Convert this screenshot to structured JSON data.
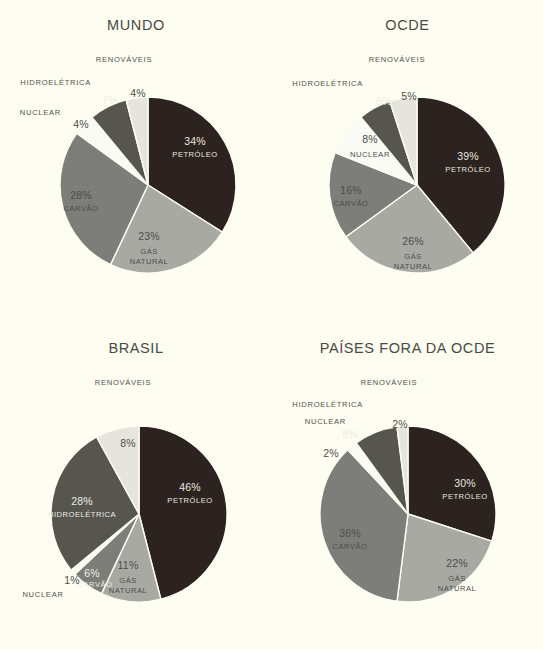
{
  "background": "#fdfdf2",
  "palette": {
    "petroleo": "#2c2220",
    "gas_natural": "#a9a9a4",
    "carvao": "#7d7d79",
    "nuclear": "#fbfbf6",
    "hidroeletrica": "#56564f",
    "renovaveis": "#e6e5dd"
  },
  "category_labels": {
    "petroleo": "PETRÓLEO",
    "gas_natural_line1": "GÁS",
    "gas_natural_line2": "NATURAL",
    "carvao": "CARVÃO",
    "nuclear": "NUCLEAR",
    "hidroeletrica": "HIDROELÉTRICA",
    "renovaveis": "RENOVÁVEIS"
  },
  "chart_data": [
    {
      "type": "pie",
      "title": "MUNDO",
      "categories": [
        "PETRÓLEO",
        "GÁS NATURAL",
        "CARVÃO",
        "NUCLEAR",
        "HIDROELÉTRICA",
        "RENOVÁVEIS"
      ],
      "values": [
        34,
        23,
        28,
        4,
        7,
        4
      ],
      "labels": [
        "34%",
        "23%",
        "28%",
        "4%",
        "7%",
        "4%"
      ],
      "legend_position": "in-slice-and-external",
      "external_labels": [
        "RENOVÁVEIS",
        "HIDROELÉTRICA",
        "NUCLEAR"
      ]
    },
    {
      "type": "pie",
      "title": "OCDE",
      "categories": [
        "PETRÓLEO",
        "GÁS NATURAL",
        "CARVÃO",
        "NUCLEAR",
        "HIDROELÉTRICA",
        "RENOVÁVEIS"
      ],
      "values": [
        39,
        26,
        16,
        8,
        6,
        5
      ],
      "labels": [
        "39%",
        "26%",
        "16%",
        "8%",
        "6%",
        "5%"
      ],
      "legend_position": "in-slice-and-external",
      "external_labels": [
        "RENOVÁVEIS",
        "HIDROELÉTRICA"
      ]
    },
    {
      "type": "pie",
      "title": "BRASIL",
      "categories": [
        "PETRÓLEO",
        "GÁS NATURAL",
        "CARVÃO",
        "NUCLEAR",
        "HIDROELÉTRICA",
        "RENOVÁVEIS"
      ],
      "values": [
        46,
        11,
        6,
        1,
        28,
        8
      ],
      "labels": [
        "46%",
        "11%",
        "6%",
        "1%",
        "28%",
        "8%"
      ],
      "legend_position": "in-slice-and-external",
      "external_labels": [
        "RENOVÁVEIS",
        "NUCLEAR"
      ]
    },
    {
      "type": "pie",
      "title": "PAÍSES FORA DA OCDE",
      "categories": [
        "PETRÓLEO",
        "GÁS NATURAL",
        "CARVÃO",
        "NUCLEAR",
        "HIDROELÉTRICA",
        "RENOVÁVEIS"
      ],
      "values": [
        30,
        22,
        36,
        2,
        8,
        2
      ],
      "labels": [
        "30%",
        "22%",
        "36%",
        "2%",
        "8%",
        "2%"
      ],
      "legend_position": "in-slice-and-external",
      "external_labels": [
        "RENOVÁVEIS",
        "HIDROELÉTRICA",
        "NUCLEAR"
      ]
    }
  ],
  "charts": {
    "mundo": {
      "title": "MUNDO",
      "petroleo_pct": "34%",
      "petroleo_cat": "PETRÓLEO",
      "gas_pct": "23%",
      "gas_cat1": "GÁS",
      "gas_cat2": "NATURAL",
      "carvao_pct": "28%",
      "carvao_cat": "CARVÃO",
      "nuclear_pct": "4%",
      "nuclear_cat": "NUCLEAR",
      "hidro_pct": "7%",
      "hidro_cat": "HIDROELÉTRICA",
      "renov_pct": "4%",
      "renov_cat": "RENOVÁVEIS"
    },
    "ocde": {
      "title": "OCDE",
      "petroleo_pct": "39%",
      "petroleo_cat": "PETRÓLEO",
      "gas_pct": "26%",
      "gas_cat1": "GÁS",
      "gas_cat2": "NATURAL",
      "carvao_pct": "16%",
      "carvao_cat": "CARVÃO",
      "nuclear_pct": "8%",
      "nuclear_cat": "NUCLEAR",
      "hidro_pct": "6%",
      "hidro_cat": "HIDROELÉTRICA",
      "renov_pct": "5%",
      "renov_cat": "RENOVÁVEIS"
    },
    "brasil": {
      "title": "BRASIL",
      "petroleo_pct": "46%",
      "petroleo_cat": "PETRÓLEO",
      "gas_pct": "11%",
      "gas_cat1": "GÁS",
      "gas_cat2": "NATURAL",
      "carvao_pct": "6%",
      "carvao_cat": "CARVÃO",
      "nuclear_pct": "1%",
      "nuclear_cat": "NUCLEAR",
      "hidro_pct": "28%",
      "hidro_cat": "HIDROELÉTRICA",
      "renov_pct": "8%",
      "renov_cat": "RENOVÁVEIS"
    },
    "fora_ocde": {
      "title": "PAÍSES FORA DA OCDE",
      "petroleo_pct": "30%",
      "petroleo_cat": "PETRÓLEO",
      "gas_pct": "22%",
      "gas_cat1": "GÁS",
      "gas_cat2": "NATURAL",
      "carvao_pct": "36%",
      "carvao_cat": "CARVÃO",
      "nuclear_pct": "2%",
      "nuclear_cat": "NUCLEAR",
      "hidro_pct": "8%",
      "hidro_cat": "HIDROELÉTRICA",
      "renov_pct": "2%",
      "renov_cat": "RENOVÁVEIS"
    }
  }
}
